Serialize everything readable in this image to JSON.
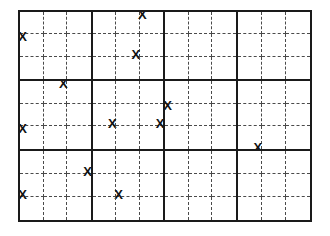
{
  "figure": {
    "type": "quadrat-sampling-grid",
    "x_symbol": "X",
    "major_rows": 3,
    "major_cols": 4,
    "sub_rows": 3,
    "sub_cols": 3,
    "total_x_marks": 12,
    "colors": {
      "background": "#ffffff",
      "major_line": "#1a1a1a",
      "sub_line": "#4a4a4a",
      "mark": "#111111"
    },
    "marks": [
      {
        "major_row": 0,
        "major_col": 0,
        "sub_row": 1,
        "sub_col": 0,
        "anchor": "x-anchor-tl"
      },
      {
        "major_row": 0,
        "major_col": 1,
        "sub_row": 0,
        "sub_col": 2,
        "anchor": "x-anchor-tl"
      },
      {
        "major_row": 0,
        "major_col": 1,
        "sub_row": 1,
        "sub_col": 1,
        "anchor": "x-anchor-br"
      },
      {
        "major_row": 1,
        "major_col": 0,
        "sub_row": 0,
        "sub_col": 1,
        "anchor": "x-anchor-tr"
      },
      {
        "major_row": 1,
        "major_col": 0,
        "sub_row": 2,
        "sub_col": 0,
        "anchor": "x-anchor-tl"
      },
      {
        "major_row": 1,
        "major_col": 1,
        "sub_row": 1,
        "sub_col": 0,
        "anchor": "x-anchor-br"
      },
      {
        "major_row": 1,
        "major_col": 1,
        "sub_row": 1,
        "sub_col": 2,
        "anchor": "x-anchor-br"
      },
      {
        "major_row": 1,
        "major_col": 2,
        "sub_row": 1,
        "sub_col": 0,
        "anchor": "x-anchor-tl"
      },
      {
        "major_row": 1,
        "major_col": 3,
        "sub_row": 2,
        "sub_col": 0,
        "anchor": "x-anchor-br"
      },
      {
        "major_row": 2,
        "major_col": 0,
        "sub_row": 0,
        "sub_col": 2,
        "anchor": "x-anchor-br"
      },
      {
        "major_row": 2,
        "major_col": 0,
        "sub_row": 1,
        "sub_col": 0,
        "anchor": "x-anchor-bl"
      },
      {
        "major_row": 2,
        "major_col": 1,
        "sub_row": 1,
        "sub_col": 1,
        "anchor": "x-anchor-bl"
      }
    ]
  }
}
